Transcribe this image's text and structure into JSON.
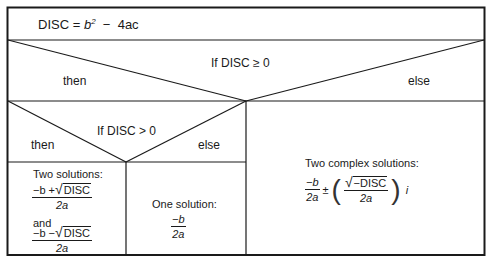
{
  "header": {
    "disc_label": "DISC",
    "equals": "=",
    "b": "b",
    "exp": "2",
    "minus": "−",
    "rest": "4ac"
  },
  "decision1": {
    "condition": "If DISC ≥ 0",
    "then_label": "then",
    "else_label": "else"
  },
  "decision2": {
    "condition": "If DISC > 0",
    "then_label": "then",
    "else_label": "else"
  },
  "two_solutions": {
    "title": "Two solutions:",
    "plus_numerator_prefix": "−b +",
    "minus_numerator_prefix": "−b −",
    "radicand": "DISC",
    "denominator": "2a",
    "and_label": "and"
  },
  "one_solution": {
    "title": "One solution:",
    "numerator": "−b",
    "denominator": "2a"
  },
  "complex_solutions": {
    "title": "Two complex solutions:",
    "real_numerator": "−b",
    "real_denominator": "2a",
    "pm": "±",
    "radicand": "−DISC",
    "imag_denominator": "2a",
    "imag_unit": "i",
    "lparen": "(",
    "rparen": ")"
  },
  "colors": {
    "line": "#1a1a1a",
    "background": "#ffffff"
  }
}
